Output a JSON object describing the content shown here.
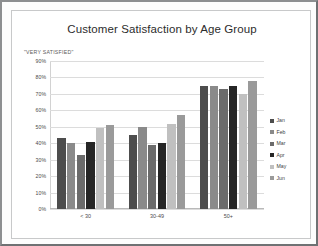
{
  "chart_data": {
    "type": "bar",
    "title": "Customer Satisfaction by Age Group",
    "ylabel": "\"VERY SATISFIED\"",
    "xlabel": "",
    "categories": [
      "< 30",
      "30-49",
      "50+"
    ],
    "series": [
      {
        "name": "Jan",
        "color": "#4d4d4d",
        "values": [
          43,
          45,
          75
        ]
      },
      {
        "name": "Feb",
        "color": "#8a8a8a",
        "values": [
          40,
          50,
          75
        ]
      },
      {
        "name": "Mar",
        "color": "#6b6b6b",
        "values": [
          33,
          39,
          73
        ]
      },
      {
        "name": "Apr",
        "color": "#262626",
        "values": [
          41,
          40,
          75
        ]
      },
      {
        "name": "May",
        "color": "#c0c0c0",
        "values": [
          49,
          52,
          70
        ]
      },
      {
        "name": "Jun",
        "color": "#9a9a9a",
        "values": [
          51,
          57,
          78
        ]
      }
    ],
    "ylim": [
      0,
      90
    ],
    "ytick_labels": [
      "90%",
      "80%",
      "70%",
      "60%",
      "50%",
      "40%",
      "30%",
      "20%",
      "10%",
      "0%"
    ],
    "ytick_values": [
      90,
      80,
      70,
      60,
      50,
      40,
      30,
      20,
      10,
      0
    ],
    "grid": true,
    "legend_position": "right"
  }
}
